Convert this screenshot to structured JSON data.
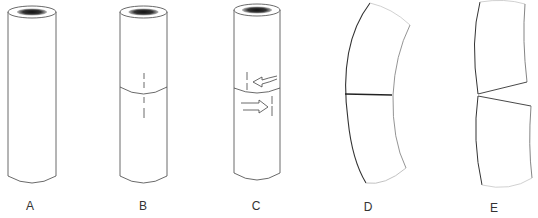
{
  "figure": {
    "panels": [
      {
        "id": "A",
        "label": "A",
        "description": "intact hollow cylinder"
      },
      {
        "id": "B",
        "label": "B",
        "description": "cylinder with transverse cut and aligned reference marks"
      },
      {
        "id": "C",
        "label": "C",
        "description": "cut cylinder with segments rotated in opposite directions (arrows), reference marks offset"
      },
      {
        "id": "D",
        "label": "D",
        "description": "curved tube with closed transverse seam"
      },
      {
        "id": "E",
        "label": "E",
        "description": "curved tube with wedge-shaped gap opening at the cut"
      }
    ],
    "colors": {
      "line": "#333333",
      "fill": "#ffffff",
      "lumen": "#222222"
    }
  }
}
